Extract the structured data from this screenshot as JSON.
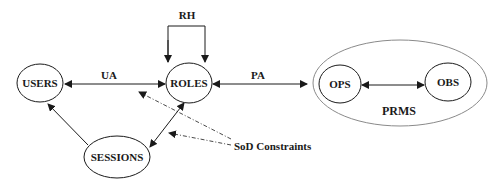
{
  "diagram": {
    "type": "RBAC model",
    "nodes": {
      "users": "USERS",
      "roles": "ROLES",
      "sessions": "SESSIONS",
      "ops": "OPS",
      "obs": "OBS",
      "prms": "PRMS"
    },
    "edges": {
      "ua": "UA",
      "pa": "PA",
      "rh": "RH"
    },
    "annotations": {
      "sod": "SoD Constraints"
    },
    "colors": {
      "stroke": "#1a1a1a",
      "group_stroke": "#8a8a8a",
      "background": "#ffffff"
    }
  }
}
